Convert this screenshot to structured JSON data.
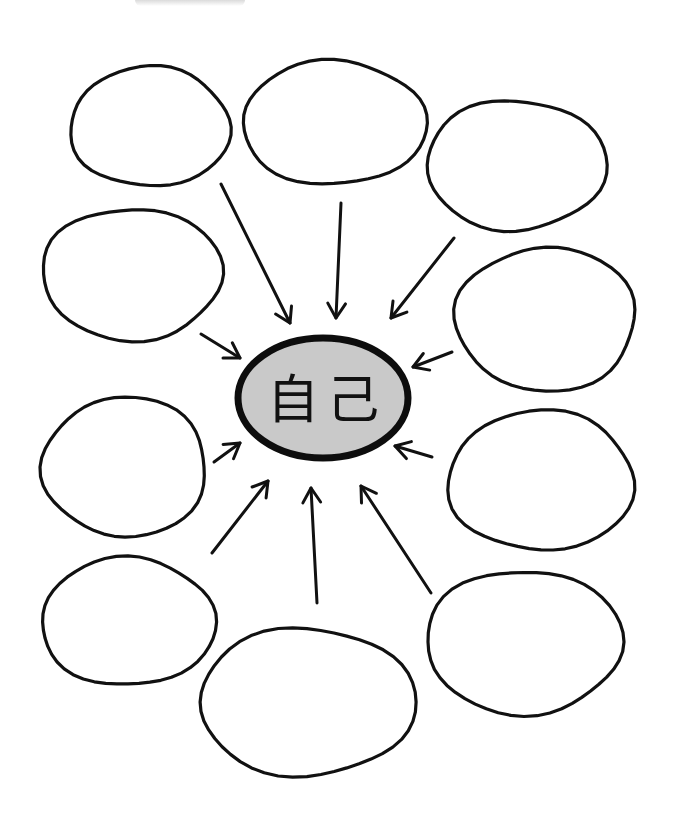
{
  "diagram": {
    "type": "mind-map",
    "center": {
      "label": "自己",
      "cx": 323,
      "cy": 398,
      "rx": 85,
      "ry": 60,
      "fill": "#c9c9c9",
      "stroke": "#0d0d0d"
    },
    "bubbles": [
      {
        "id": "top-left",
        "label": "",
        "cx": 150,
        "cy": 127,
        "rx": 80,
        "ry": 60
      },
      {
        "id": "top-center",
        "label": "",
        "cx": 334,
        "cy": 123,
        "rx": 92,
        "ry": 62
      },
      {
        "id": "top-right",
        "label": "",
        "cx": 516,
        "cy": 165,
        "rx": 90,
        "ry": 65
      },
      {
        "id": "left-upper",
        "label": "",
        "cx": 132,
        "cy": 274,
        "rx": 90,
        "ry": 66
      },
      {
        "id": "right-upper",
        "label": "",
        "cx": 546,
        "cy": 319,
        "rx": 90,
        "ry": 72
      },
      {
        "id": "left-lower",
        "label": "",
        "cx": 125,
        "cy": 467,
        "rx": 82,
        "ry": 70
      },
      {
        "id": "right-lower",
        "label": "",
        "cx": 541,
        "cy": 481,
        "rx": 93,
        "ry": 70
      },
      {
        "id": "bottom-left",
        "label": "",
        "cx": 128,
        "cy": 622,
        "rx": 87,
        "ry": 64
      },
      {
        "id": "bottom-center",
        "label": "",
        "cx": 307,
        "cy": 702,
        "rx": 108,
        "ry": 74
      },
      {
        "id": "bottom-right",
        "label": "",
        "cx": 524,
        "cy": 642,
        "rx": 98,
        "ry": 72
      }
    ],
    "arrows": [
      {
        "from": "top-left",
        "x1": 221,
        "y1": 184,
        "x2": 290,
        "y2": 323
      },
      {
        "from": "top-center",
        "x1": 341,
        "y1": 203,
        "x2": 336,
        "y2": 318
      },
      {
        "from": "top-right",
        "x1": 454,
        "y1": 238,
        "x2": 391,
        "y2": 318
      },
      {
        "from": "left-upper",
        "x1": 201,
        "y1": 334,
        "x2": 240,
        "y2": 358
      },
      {
        "from": "right-upper",
        "x1": 452,
        "y1": 352,
        "x2": 413,
        "y2": 367
      },
      {
        "from": "left-lower",
        "x1": 214,
        "y1": 462,
        "x2": 240,
        "y2": 443
      },
      {
        "from": "right-lower",
        "x1": 432,
        "y1": 457,
        "x2": 395,
        "y2": 446
      },
      {
        "from": "bottom-left",
        "x1": 212,
        "y1": 553,
        "x2": 268,
        "y2": 481
      },
      {
        "from": "bottom-center",
        "x1": 317,
        "y1": 603,
        "x2": 311,
        "y2": 488
      },
      {
        "from": "bottom-right",
        "x1": 431,
        "y1": 593,
        "x2": 361,
        "y2": 486
      }
    ],
    "colors": {
      "background": "#ffffff",
      "ink": "#111111",
      "center_fill": "#c9c9c9"
    }
  }
}
